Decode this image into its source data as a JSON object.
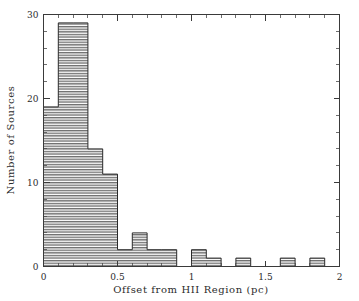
{
  "chart_data": {
    "type": "bar",
    "title": "",
    "subtitle": "",
    "xlabel": "Offset from HII Region (pc)",
    "ylabel": "Number of Sources",
    "xlim": [
      0,
      2
    ],
    "ylim": [
      0,
      30
    ],
    "bin_width": 0.1,
    "grid": false,
    "legend": null,
    "legend_position": "none",
    "xticks": [
      0,
      0.5,
      1,
      1.5,
      2
    ],
    "xtick_labels": [
      "0",
      "0.5",
      "1",
      "1.5",
      "2"
    ],
    "yticks": [
      0,
      10,
      20,
      30
    ],
    "ytick_labels": [
      "0",
      "10",
      "20",
      "30"
    ],
    "x_minor_tick_interval": 0.1,
    "y_minor_tick_interval": 2,
    "bar_fill": "horizontal-hatch",
    "bar_edge_color": "#2b2b2b",
    "axis_color": "#3a3a3a",
    "background_color": "#ffffff",
    "bin_edges": [
      0,
      0.1,
      0.2,
      0.3,
      0.4,
      0.5,
      0.6,
      0.7,
      0.8,
      0.9,
      1.0,
      1.1,
      1.2,
      1.3,
      1.4,
      1.5,
      1.6,
      1.7,
      1.8,
      1.9,
      2.0
    ],
    "categories": [
      "0.0-0.1",
      "0.1-0.2",
      "0.2-0.3",
      "0.3-0.4",
      "0.4-0.5",
      "0.5-0.6",
      "0.6-0.7",
      "0.7-0.8",
      "0.8-0.9",
      "0.9-1.0",
      "1.0-1.1",
      "1.1-1.2",
      "1.2-1.3",
      "1.3-1.4",
      "1.4-1.5",
      "1.5-1.6",
      "1.6-1.7",
      "1.7-1.8",
      "1.8-1.9",
      "1.9-2.0"
    ],
    "values": [
      19,
      29,
      29,
      14,
      11,
      2,
      4,
      2,
      2,
      0,
      2,
      1,
      0,
      1,
      0,
      0,
      1,
      0,
      1,
      0
    ],
    "total_sources": 120
  },
  "axes": {
    "x_title": "Offset from HII Region (pc)",
    "y_title": "Number of Sources"
  }
}
